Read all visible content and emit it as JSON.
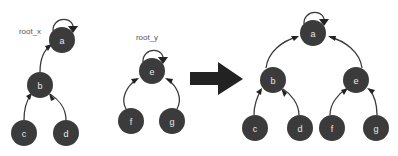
{
  "figure": {
    "background_color": "#ffffff",
    "node_color": "#3b3b3b",
    "node_label_color": "#e8e8e8",
    "edge_color": "#3b3b3b",
    "arrow_color": "#222222",
    "root_label_color": "#555555",
    "transition_arrow_glyph": "right-arrow"
  },
  "left_tree": {
    "root_label": "root_x",
    "nodes": [
      {
        "id": "a",
        "label": "a",
        "x": 62,
        "y": 40,
        "r": 13,
        "self_loop": true
      },
      {
        "id": "b",
        "label": "b",
        "x": 40,
        "y": 85,
        "r": 13,
        "self_loop": false
      },
      {
        "id": "c",
        "label": "c",
        "x": 24,
        "y": 133,
        "r": 13,
        "self_loop": false
      },
      {
        "id": "d",
        "label": "d",
        "x": 66,
        "y": 133,
        "r": 13,
        "self_loop": false
      }
    ],
    "edges": [
      {
        "from": "b",
        "to": "a"
      },
      {
        "from": "c",
        "to": "b"
      },
      {
        "from": "d",
        "to": "b"
      }
    ]
  },
  "middle_tree": {
    "root_label": "root_y",
    "nodes": [
      {
        "id": "e",
        "label": "e",
        "x": 152,
        "y": 71,
        "r": 13,
        "self_loop": true
      },
      {
        "id": "f",
        "label": "f",
        "x": 131,
        "y": 121,
        "r": 13,
        "self_loop": false
      },
      {
        "id": "g",
        "label": "g",
        "x": 172,
        "y": 121,
        "r": 13,
        "self_loop": false
      }
    ],
    "edges": [
      {
        "from": "f",
        "to": "e"
      },
      {
        "from": "g",
        "to": "e"
      }
    ]
  },
  "right_tree": {
    "root_label": "",
    "nodes": [
      {
        "id": "a",
        "label": "a",
        "x": 313,
        "y": 33,
        "r": 13,
        "self_loop": true
      },
      {
        "id": "b",
        "label": "b",
        "x": 273,
        "y": 80,
        "r": 13,
        "self_loop": false
      },
      {
        "id": "e",
        "label": "e",
        "x": 356,
        "y": 80,
        "r": 13,
        "self_loop": false
      },
      {
        "id": "c",
        "label": "c",
        "x": 255,
        "y": 128,
        "r": 13,
        "self_loop": false
      },
      {
        "id": "d",
        "label": "d",
        "x": 300,
        "y": 128,
        "r": 13,
        "self_loop": false
      },
      {
        "id": "f",
        "label": "f",
        "x": 332,
        "y": 128,
        "r": 13,
        "self_loop": false
      },
      {
        "id": "g",
        "label": "g",
        "x": 376,
        "y": 128,
        "r": 13,
        "self_loop": false
      }
    ],
    "edges": [
      {
        "from": "b",
        "to": "a"
      },
      {
        "from": "e",
        "to": "a"
      },
      {
        "from": "c",
        "to": "b"
      },
      {
        "from": "d",
        "to": "b"
      },
      {
        "from": "f",
        "to": "e"
      },
      {
        "from": "g",
        "to": "e"
      }
    ]
  }
}
